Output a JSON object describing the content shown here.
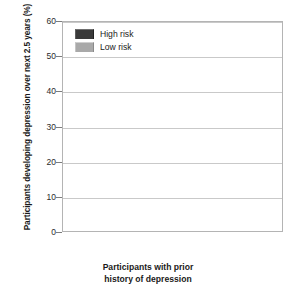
{
  "chart_data": {
    "type": "bar",
    "title": "",
    "categories": [
      "Major depression",
      "Minor depression"
    ],
    "series": [
      {
        "name": "High risk",
        "color": "#3a3a3a",
        "values": [
          27,
          50
        ]
      },
      {
        "name": "Low risk",
        "color": "#a9a9a9",
        "values": [
          6,
          27
        ]
      }
    ],
    "xlabel_lines": [
      "Participants with prior",
      "history of depression"
    ],
    "ylabel": "Participants developing depression over next 2.5 years (%)",
    "ylim": [
      0,
      60
    ],
    "yticks": [
      0,
      10,
      20,
      30,
      40,
      50,
      60
    ],
    "ytick_labels": [
      "0",
      "10",
      "20",
      "30",
      "40",
      "50",
      "60"
    ],
    "grid": "horizontal",
    "legend_position": "top-left-inside",
    "legend": [
      "High risk",
      "Low risk"
    ]
  },
  "axes": {
    "y_title": "Participants developing depression over next 2.5 years (%)",
    "x_title_line1": "Participants with prior",
    "x_title_line2": "history of depression"
  },
  "legend": {
    "items": [
      {
        "label": "High risk",
        "swatch": "dark-swatch-icon"
      },
      {
        "label": "Low risk",
        "swatch": "light-swatch-icon"
      }
    ]
  },
  "categories": [
    {
      "label": "Major depression"
    },
    {
      "label": "Minor depression"
    }
  ]
}
